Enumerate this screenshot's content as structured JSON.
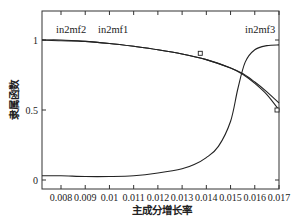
{
  "chart_data": {
    "type": "line",
    "title": "",
    "xlabel": "主成分增长率",
    "ylabel": "隶属函数",
    "xlim": [
      0.0072,
      0.017
    ],
    "ylim": [
      -0.06,
      1.21
    ],
    "x_ticks": [
      "0.008",
      "0.009",
      "0.01",
      "0.011",
      "0.012",
      "0.013",
      "0.014",
      "0.015",
      "0.016",
      "0.017"
    ],
    "y_ticks": [
      "0",
      "0.5",
      "1"
    ],
    "grid": false,
    "legend": "inline labels",
    "series": [
      {
        "name": "in2mf2",
        "points": [
          [
            0.0072,
            1.0
          ],
          [
            0.008,
            1.0
          ],
          [
            0.009,
            0.99
          ],
          [
            0.01,
            0.975
          ],
          [
            0.011,
            0.955
          ],
          [
            0.012,
            0.93
          ],
          [
            0.013,
            0.9
          ],
          [
            0.014,
            0.86
          ],
          [
            0.015,
            0.8
          ],
          [
            0.0155,
            0.76
          ],
          [
            0.016,
            0.7
          ],
          [
            0.0165,
            0.63
          ],
          [
            0.017,
            0.55
          ]
        ]
      },
      {
        "name": "in2mf1",
        "points": [
          [
            0.0072,
            1.0
          ],
          [
            0.008,
            0.995
          ],
          [
            0.009,
            0.99
          ],
          [
            0.01,
            0.975
          ],
          [
            0.011,
            0.955
          ],
          [
            0.012,
            0.93
          ],
          [
            0.013,
            0.9
          ],
          [
            0.014,
            0.86
          ],
          [
            0.015,
            0.8
          ],
          [
            0.0155,
            0.755
          ],
          [
            0.016,
            0.69
          ],
          [
            0.0165,
            0.61
          ],
          [
            0.017,
            0.5
          ]
        ]
      },
      {
        "name": "in2mf3",
        "points": [
          [
            0.0072,
            0.03
          ],
          [
            0.008,
            0.03
          ],
          [
            0.009,
            0.025
          ],
          [
            0.01,
            0.025
          ],
          [
            0.011,
            0.03
          ],
          [
            0.012,
            0.05
          ],
          [
            0.013,
            0.08
          ],
          [
            0.0135,
            0.11
          ],
          [
            0.014,
            0.16
          ],
          [
            0.0145,
            0.24
          ],
          [
            0.015,
            0.42
          ],
          [
            0.0153,
            0.65
          ],
          [
            0.0156,
            0.84
          ],
          [
            0.016,
            0.93
          ],
          [
            0.0165,
            0.96
          ],
          [
            0.017,
            0.965
          ]
        ]
      }
    ],
    "markers": [
      {
        "series": "in2mf2",
        "x": 0.01375,
        "y": 0.905,
        "shape": "square"
      },
      {
        "series": "in2mf1",
        "x": 0.017,
        "y": 0.5,
        "shape": "square"
      }
    ],
    "annotations": [
      {
        "text": "in2mf2",
        "x": 0.0081,
        "y": 1.06
      },
      {
        "text": "in2mf1",
        "x": 0.00995,
        "y": 1.06
      },
      {
        "text": "in2mf3",
        "x": 0.0162,
        "y": 1.06
      }
    ]
  },
  "labels": {
    "xlabel": "主成分增长率",
    "ylabel": "隶属函数",
    "curve1": "in2mf2",
    "curve2": "in2mf1",
    "curve3": "in2mf3"
  },
  "ticks": {
    "x": [
      "0.008",
      "0.009",
      "0.01",
      "0.011",
      "0.012",
      "0.013",
      "0.014",
      "0.015",
      "0.016",
      "0.017"
    ],
    "y": [
      "0",
      "0.5",
      "1"
    ]
  }
}
